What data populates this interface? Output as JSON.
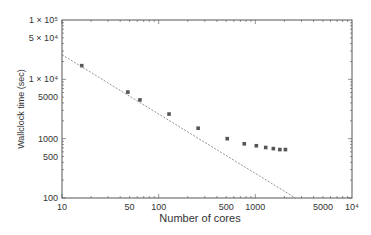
{
  "chart_data": {
    "type": "scatter",
    "title": "",
    "xlabel": "Number of cores",
    "ylabel": "Wallclock time (sec)",
    "xscale": "log",
    "yscale": "log",
    "xlim": [
      10,
      10000
    ],
    "ylim": [
      100,
      100000
    ],
    "grid": false,
    "legend": null,
    "x_ticks": [
      {
        "value": 10,
        "label": "10"
      },
      {
        "value": 50,
        "label": "50"
      },
      {
        "value": 100,
        "label": "100"
      },
      {
        "value": 500,
        "label": "500"
      },
      {
        "value": 1000,
        "label": "1000"
      },
      {
        "value": 5000,
        "label": "5000"
      },
      {
        "value": 10000,
        "label": "10⁴"
      }
    ],
    "y_ticks": [
      {
        "value": 100,
        "label": "100"
      },
      {
        "value": 500,
        "label": "500"
      },
      {
        "value": 1000,
        "label": "1000"
      },
      {
        "value": 5000,
        "label": "5000"
      },
      {
        "value": 10000,
        "label": "1 × 10⁴"
      },
      {
        "value": 50000,
        "label": "5 × 10⁴"
      },
      {
        "value": 100000,
        "label": "1 × 10⁵"
      }
    ],
    "series": [
      {
        "name": "Measured",
        "style": "markers",
        "color": "#555555",
        "x": [
          16,
          48,
          64,
          128,
          256,
          512,
          768,
          1024,
          1280,
          1536,
          1792,
          2048
        ],
        "y": [
          17000,
          6100,
          4500,
          2600,
          1500,
          1000,
          820,
          760,
          710,
          680,
          655,
          655
        ]
      },
      {
        "name": "Ideal scaling",
        "style": "dashed",
        "color": "#777777",
        "x": [
          10,
          2600
        ],
        "y": [
          26000,
          100
        ]
      }
    ]
  }
}
